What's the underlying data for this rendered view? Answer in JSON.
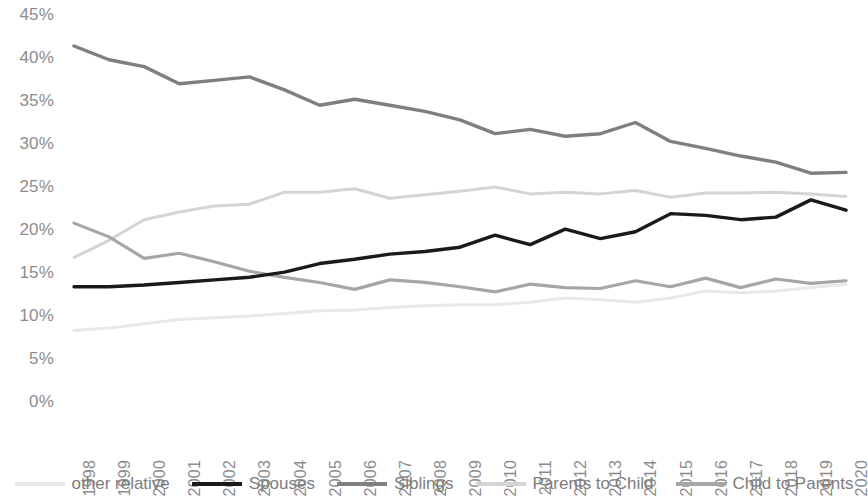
{
  "chart_data": {
    "type": "line",
    "title": "",
    "subtitle": "",
    "xlabel": "",
    "ylabel": "",
    "grid": false,
    "legend_position": "bottom",
    "ylim": [
      0,
      45
    ],
    "ytick_values": [
      45,
      40,
      35,
      30,
      25,
      20,
      15,
      10,
      5,
      0
    ],
    "ytick_labels": [
      "45%",
      "40%",
      "35%",
      "30%",
      "25%",
      "20%",
      "15%",
      "10%",
      "5%",
      "0%"
    ],
    "categories": [
      "1998",
      "1999",
      "2000",
      "2001",
      "2002",
      "2003",
      "2004",
      "2005",
      "2006",
      "2007",
      "2008",
      "2009",
      "2010",
      "2011",
      "2012",
      "2013",
      "2014",
      "2015",
      "2016",
      "2017",
      "2018",
      "2019",
      "2020"
    ],
    "series": [
      {
        "name": "other relative",
        "color": "#e8e8e8",
        "width": 3,
        "values": [
          8.3,
          8.6,
          9.1,
          9.6,
          9.8,
          10.0,
          10.3,
          10.6,
          10.7,
          11.0,
          11.2,
          11.3,
          11.3,
          11.6,
          12.1,
          11.9,
          11.6,
          12.1,
          12.9,
          12.7,
          12.9,
          13.3,
          13.7
        ]
      },
      {
        "name": "Spouses",
        "color": "#1a1a1a",
        "width": 3.4,
        "values": [
          13.4,
          13.4,
          13.6,
          13.9,
          14.2,
          14.5,
          15.1,
          16.1,
          16.6,
          17.2,
          17.5,
          18.0,
          19.4,
          18.3,
          20.1,
          19.0,
          19.8,
          21.9,
          21.7,
          21.2,
          21.5,
          23.5,
          22.3
        ]
      },
      {
        "name": "Siblings",
        "color": "#7f7f7f",
        "width": 3.4,
        "values": [
          41.4,
          39.8,
          39.0,
          37.0,
          37.4,
          37.8,
          36.3,
          34.5,
          35.2,
          34.5,
          33.8,
          32.8,
          31.2,
          31.7,
          30.9,
          31.2,
          32.5,
          30.3,
          29.5,
          28.6,
          27.9,
          26.6,
          26.7
        ]
      },
      {
        "name": "Parents to Child",
        "color": "#d4d4d4",
        "width": 3,
        "values": [
          16.8,
          18.8,
          21.2,
          22.1,
          22.8,
          23.0,
          24.4,
          24.4,
          24.8,
          23.7,
          24.1,
          24.5,
          25.0,
          24.2,
          24.4,
          24.2,
          24.6,
          23.8,
          24.3,
          24.3,
          24.4,
          24.2,
          23.9
        ]
      },
      {
        "name": "Child to Parents",
        "color": "#a6a6a6",
        "width": 3.2,
        "values": [
          20.8,
          19.2,
          16.7,
          17.3,
          16.3,
          15.2,
          14.5,
          13.9,
          13.1,
          14.2,
          13.9,
          13.4,
          12.8,
          13.7,
          13.3,
          13.2,
          14.1,
          13.4,
          14.4,
          13.3,
          14.3,
          13.8,
          14.1
        ]
      }
    ]
  },
  "legend": {
    "items": [
      {
        "label": "other relative"
      },
      {
        "label": "Spouses"
      },
      {
        "label": "Siblings"
      },
      {
        "label": "Parents to Child"
      },
      {
        "label": "Child to Parents"
      }
    ]
  }
}
